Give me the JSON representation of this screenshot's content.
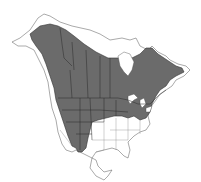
{
  "map": {
    "region": "North America",
    "type": "species-range-map",
    "legend": [],
    "colors": {
      "range_fill": "#6b6b6b",
      "land_fill": "#ffffff",
      "boundary": "#333333",
      "background": "#ffffff"
    }
  }
}
